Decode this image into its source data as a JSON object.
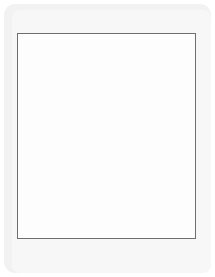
{
  "board": {
    "title": "Xiangqi Board",
    "columns": 9,
    "rows": 10,
    "top_labels": [
      "1",
      "2",
      "3",
      "4",
      "5",
      "6",
      "7",
      "8",
      "9"
    ],
    "bottom_labels": [
      "九",
      "八",
      "七",
      "六",
      "五",
      "四",
      "三",
      "二",
      "一"
    ],
    "colors": {
      "page_background": "#ffffff",
      "panel_background": "#f2f2f2",
      "board_background": "#fdfdfd",
      "frame_line": "#6e6e6e",
      "grid_line": "#b9b9b9",
      "marker": "#c9c9c9",
      "black_piece_fill": "#1b1b1b",
      "black_piece_text": "#ffffff",
      "red_piece_fill": "#dcdcdc",
      "red_piece_text": "#4a4a4a",
      "label_text": "#adadad"
    }
  },
  "pieces": [
    {
      "name": "black-cannon-c2-r0",
      "label": "炮",
      "side": "black",
      "col": 2,
      "row": 0
    },
    {
      "name": "black-elephant-c3-r0",
      "label": "象",
      "side": "black",
      "col": 3,
      "row": 0
    },
    {
      "name": "black-general-c4-r0",
      "label": "将",
      "side": "black",
      "col": 4,
      "row": 0
    },
    {
      "name": "black-advisor-c6-r0",
      "label": "士",
      "side": "black",
      "col": 6,
      "row": 0
    },
    {
      "name": "black-chariot-c7-r0",
      "label": "车",
      "side": "black",
      "col": 7,
      "row": 0
    },
    {
      "name": "black-advisor-c5-r1",
      "label": "士",
      "side": "black",
      "col": 5,
      "row": 1
    },
    {
      "name": "black-horse-c4-r2",
      "label": "马",
      "side": "black",
      "col": 4,
      "row": 2
    },
    {
      "name": "black-chariot-c1-r3",
      "label": "车",
      "side": "black",
      "col": 1,
      "row": 3
    },
    {
      "name": "black-pawn-c5-r3",
      "label": "卒",
      "side": "black",
      "col": 5,
      "row": 3
    },
    {
      "name": "red-chariot-c4-r6",
      "label": "车",
      "side": "red",
      "col": 4,
      "row": 6
    },
    {
      "name": "black-pawn-c3-r7",
      "label": "卒",
      "side": "black",
      "col": 3,
      "row": 7
    },
    {
      "name": "black-pawn-c4-r7",
      "label": "卒",
      "side": "black",
      "col": 4,
      "row": 7
    },
    {
      "name": "red-cannon-c5-r7",
      "label": "炮",
      "side": "red",
      "col": 5,
      "row": 7
    },
    {
      "name": "black-cannon-c3-r8",
      "label": "炮",
      "side": "black",
      "col": 3,
      "row": 8
    },
    {
      "name": "black-pawn-c5-r8",
      "label": "卒",
      "side": "black",
      "col": 5,
      "row": 8
    },
    {
      "name": "red-general-c4-r9",
      "label": "帅",
      "side": "red",
      "col": 4,
      "row": 9
    }
  ],
  "markers": [
    {
      "col": 2,
      "row": 2
    },
    {
      "col": 8,
      "row": 2
    },
    {
      "col": 1,
      "row": 3
    },
    {
      "col": 3,
      "row": 3
    },
    {
      "col": 5,
      "row": 3
    },
    {
      "col": 7,
      "row": 3
    },
    {
      "col": 9,
      "row": 3
    },
    {
      "col": 2,
      "row": 7
    },
    {
      "col": 8,
      "row": 7
    },
    {
      "col": 1,
      "row": 6
    },
    {
      "col": 3,
      "row": 6
    },
    {
      "col": 5,
      "row": 6
    },
    {
      "col": 7,
      "row": 6
    },
    {
      "col": 9,
      "row": 6
    }
  ],
  "palace_lines": [
    {
      "name": "top-palace-diag-1",
      "from": {
        "col": 4,
        "row": 0
      },
      "to": {
        "col": 6,
        "row": 2
      }
    },
    {
      "name": "top-palace-diag-2",
      "from": {
        "col": 6,
        "row": 0
      },
      "to": {
        "col": 4,
        "row": 2
      }
    },
    {
      "name": "bottom-palace-diag-1",
      "from": {
        "col": 4,
        "row": 7
      },
      "to": {
        "col": 6,
        "row": 9
      }
    },
    {
      "name": "bottom-palace-diag-2",
      "from": {
        "col": 6,
        "row": 7
      },
      "to": {
        "col": 4,
        "row": 9
      }
    }
  ]
}
